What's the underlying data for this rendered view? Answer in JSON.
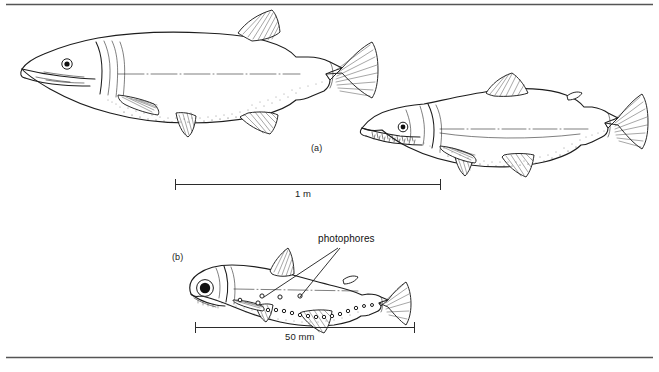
{
  "figure": {
    "background_color": "#ffffff",
    "ink_color": "#1d1d1d",
    "rule_color": "#555555",
    "width": 659,
    "height": 372,
    "top_rule": true,
    "bottom_rule": true
  },
  "panels": [
    {
      "id": "a",
      "label": "(a)",
      "subjects": [
        {
          "name": "pike",
          "description": "elongate predatory fish with duckbill snout and posteriorly placed dorsal fin"
        },
        {
          "name": "salmon",
          "description": "fusiform fish with toothed jaws, adipose fin and forked tail"
        }
      ],
      "scale_bar": {
        "label": "1 m",
        "x_start": 175,
        "x_end": 441,
        "y": 184
      }
    },
    {
      "id": "b",
      "label": "(b)",
      "subjects": [
        {
          "name": "lanternfish",
          "description": "small deep-sea fish with large eye and rows of light organs"
        }
      ],
      "annotations": [
        {
          "name": "photophores",
          "label": "photophores",
          "leader_targets": 2
        }
      ],
      "scale_bar": {
        "label": "50 mm",
        "x_start": 195,
        "x_end": 415,
        "y": 327
      }
    }
  ],
  "labels": {
    "panel_a": "(a)",
    "panel_b": "(b)",
    "scale_a": "1 m",
    "scale_b": "50 mm",
    "photophores": "photophores"
  }
}
